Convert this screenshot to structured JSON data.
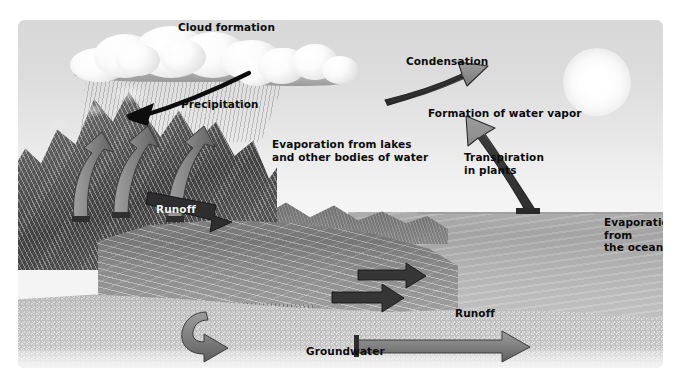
{
  "diagram": {
    "style": "grayscale scientific illustration",
    "background_color": "#ffffff",
    "plate_color": "#dcdcdc"
  },
  "labels": {
    "cloud_formation": "Cloud formation",
    "precipitation": "Precipitation",
    "condensation": "Condensation",
    "formation_of_water_vapor": "Formation of water vapor",
    "evaporation_lakes": "Evaporation from lakes\nand other bodies of water",
    "transpiration": "Transpiration\nin plants",
    "evaporation_ocean": "Evaporation from\nthe ocean",
    "runoff_mountain": "Runoff",
    "runoff_coast": "Runoff",
    "groundwater": "Groundwater"
  },
  "arrows": [
    {
      "name": "precipitation-arrow",
      "label": "Precipitation",
      "direction": "down-left",
      "color": "#111111",
      "style": "curved-solid"
    },
    {
      "name": "condensation-arrow",
      "label": "Condensation",
      "direction": "up-left",
      "color": "#6e6e6e",
      "style": "tapered-3d"
    },
    {
      "name": "evaporation-lakes-arrow-1",
      "label": "Evaporation from lakes and other bodies of water",
      "direction": "up",
      "color": "#828282",
      "style": "curved-3d"
    },
    {
      "name": "evaporation-lakes-arrow-2",
      "label": "Evaporation from lakes and other bodies of water",
      "direction": "up",
      "color": "#828282",
      "style": "curved-3d"
    },
    {
      "name": "transpiration-arrow",
      "label": "Transpiration in plants",
      "direction": "up",
      "color": "#828282",
      "style": "curved-3d"
    },
    {
      "name": "evaporation-ocean-arrow",
      "label": "Evaporation from the ocean",
      "direction": "up-left",
      "color": "#6f6f6f",
      "style": "tapered-3d"
    },
    {
      "name": "runoff-mountain-arrow",
      "label": "Runoff",
      "direction": "right-down",
      "color": "#3a3a3a",
      "style": "flat-3d"
    },
    {
      "name": "runoff-coast-arrow-1",
      "label": "Runoff",
      "direction": "right",
      "color": "#3a3a3a",
      "style": "flat-3d"
    },
    {
      "name": "runoff-coast-arrow-2",
      "label": "Runoff",
      "direction": "right",
      "color": "#3a3a3a",
      "style": "flat-3d"
    },
    {
      "name": "groundwater-arrow-left",
      "label": "Groundwater",
      "direction": "down-right",
      "color": "#7a7a7a",
      "style": "curved-3d"
    },
    {
      "name": "groundwater-arrow-right",
      "label": "Groundwater",
      "direction": "right",
      "color": "#7a7a7a",
      "style": "flat-3d"
    }
  ],
  "scene": {
    "sun": "sun-disc",
    "clouds": [
      "cumulus-large",
      "cumulus-small"
    ],
    "rain": "rain-streaks",
    "mountains": "mountain-range",
    "valley": "river-valley-farmland",
    "ocean": "ocean",
    "aquifer": "subsurface-cutaway"
  }
}
